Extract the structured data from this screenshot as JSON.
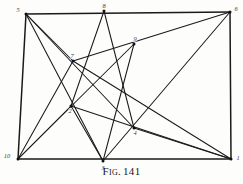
{
  "figure": {
    "caption_prefix": "Fig.",
    "caption_number": "141",
    "caption_full": "Fig. 141",
    "ink_color": "#1a1a1a",
    "background_color": "#fdfdfc",
    "label_color": "#3a3a3a"
  },
  "chart_data": {
    "type": "diagram",
    "subtitle": "",
    "xlabel": "",
    "ylabel": "",
    "grid": false,
    "legend": "none",
    "xlim": [
      0,
      243
    ],
    "ylim": [
      0,
      184
    ],
    "nodes": [
      {
        "id": "5",
        "label": "5",
        "x": 26,
        "y": 14,
        "label_dx": -8,
        "label_dy": -2
      },
      {
        "id": "8",
        "label": "8",
        "x": 104,
        "y": 11,
        "label_dx": 0,
        "label_dy": -3
      },
      {
        "id": "6",
        "label": "6",
        "x": 230,
        "y": 12,
        "label_dx": 6,
        "label_dy": -1
      },
      {
        "id": "9",
        "label": "9",
        "x": 134,
        "y": 44,
        "label_dx": 1,
        "label_dy": -3
      },
      {
        "id": "7",
        "label": "7",
        "x": 73,
        "y": 61,
        "label_dx": -1,
        "label_dy": -3
      },
      {
        "id": "2",
        "label": "2",
        "x": 71,
        "y": 106,
        "label_dx": -1,
        "label_dy": 7
      },
      {
        "id": "4",
        "label": "4",
        "x": 134,
        "y": 128,
        "label_dx": 1,
        "label_dy": 7
      },
      {
        "id": "10",
        "label": "10",
        "x": 18,
        "y": 159,
        "label_dx": -11,
        "label_dy": -1
      },
      {
        "id": "3",
        "label": "3",
        "x": 103,
        "y": 161,
        "label_dx": 0,
        "label_dy": 9
      },
      {
        "id": "1",
        "label": "1",
        "x": 231,
        "y": 159,
        "label_dx": 7,
        "label_dy": 1
      }
    ],
    "frame_edges": [
      {
        "from": "5",
        "to": "6"
      },
      {
        "from": "10",
        "to": "1"
      },
      {
        "from": "5",
        "to": "10"
      },
      {
        "from": "6",
        "to": "1"
      }
    ],
    "edges": [
      {
        "from": "5",
        "to": "7"
      },
      {
        "from": "5",
        "to": "4"
      },
      {
        "from": "5",
        "to": "3"
      },
      {
        "from": "8",
        "to": "2"
      },
      {
        "from": "8",
        "to": "4"
      },
      {
        "from": "6",
        "to": "7"
      },
      {
        "from": "6",
        "to": "3"
      },
      {
        "from": "7",
        "to": "10"
      },
      {
        "from": "7",
        "to": "1"
      },
      {
        "from": "9",
        "to": "10"
      },
      {
        "from": "9",
        "to": "3"
      },
      {
        "from": "2",
        "to": "10"
      },
      {
        "from": "2",
        "to": "3"
      },
      {
        "from": "2",
        "to": "1"
      },
      {
        "from": "4",
        "to": "1"
      }
    ]
  }
}
